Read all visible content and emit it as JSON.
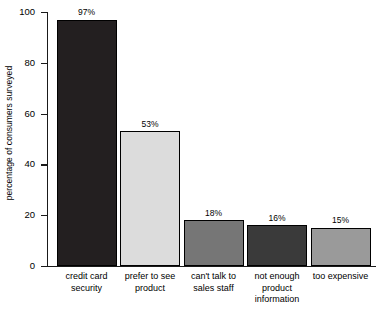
{
  "chart_data": {
    "type": "bar",
    "title": "",
    "subtitle": "",
    "xlabel": "",
    "ylabel": "percentage of consumers surveyed",
    "ylim": [
      0,
      100
    ],
    "yticks": [
      0,
      20,
      40,
      60,
      80,
      100
    ],
    "ytick_labels": [
      "0",
      "20",
      "40",
      "60",
      "80",
      "100"
    ],
    "grid": false,
    "legend": null,
    "orientation": "vertical",
    "value_label_suffix": "%",
    "categories": [
      "credit card security",
      "prefer to see product",
      "can't talk to sales staff",
      "not enough product information",
      "too expensive"
    ],
    "category_lines": [
      [
        "credit card",
        "security"
      ],
      [
        "prefer to see",
        "product"
      ],
      [
        "can't talk to",
        "sales staff"
      ],
      [
        "not enough",
        "product",
        "information"
      ],
      [
        "too expensive"
      ]
    ],
    "values": [
      97,
      53,
      18,
      16,
      15
    ],
    "value_labels": [
      "97%",
      "53%",
      "18%",
      "16%",
      "15%"
    ],
    "bar_colors": [
      "#231f20",
      "#dcdcdc",
      "#767676",
      "#3a3a3a",
      "#9a9a9a"
    ],
    "bar_edge_color": "#000000",
    "axis_color": "#1a1a1a",
    "background_color": "#ffffff",
    "text_color": "#000000"
  }
}
